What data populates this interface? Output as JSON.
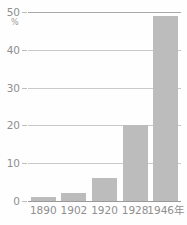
{
  "chart_data": {
    "type": "bar",
    "title": "",
    "xlabel": "",
    "ylabel": "%",
    "yunit": "%",
    "categories": [
      "1890",
      "1902",
      "1920",
      "1928",
      "1946年"
    ],
    "values": [
      1,
      2,
      6,
      20,
      49
    ],
    "ylim": [
      0,
      50
    ],
    "yticks": [
      0,
      10,
      20,
      30,
      40,
      50
    ],
    "ytick_labels": [
      "0",
      "10",
      "20",
      "30",
      "40",
      "50"
    ],
    "grid": true,
    "legend": false,
    "bar_color": "#bcbcbc",
    "grid_color": "#c9c9c9",
    "text_color": "#8f8f8f",
    "axis_color": "#9a9a9a"
  }
}
